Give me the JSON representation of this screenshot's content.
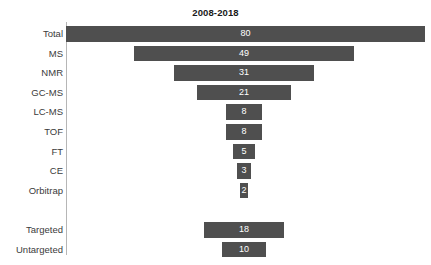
{
  "chart_data": {
    "type": "bar",
    "title": "2008-2018",
    "subtitle": "",
    "xlabel": "",
    "ylabel": "",
    "orientation": "horizontal",
    "grid": false,
    "legend": null,
    "xlim": [
      0,
      80
    ],
    "axis_visible": "y-spine-only",
    "tick_labels_x": [],
    "bar_color": "#4f4f4f",
    "value_label_color": "#ffffff",
    "background_color": "#ffffff",
    "categories": [
      "Total",
      "MS",
      "NMR",
      "GC-MS",
      "LC-MS",
      "TOF",
      "FT",
      "CE",
      "Orbitrap",
      "",
      "Targeted",
      "Untargeted"
    ],
    "values": [
      80,
      49,
      31,
      21,
      8,
      8,
      5,
      3,
      2,
      null,
      18,
      10
    ],
    "rows": [
      {
        "label": "Total",
        "value": 80,
        "value_text": "80",
        "align": "left",
        "spacer": false
      },
      {
        "label": "MS",
        "value": 49,
        "value_text": "49",
        "align": "center",
        "spacer": false
      },
      {
        "label": "NMR",
        "value": 31,
        "value_text": "31",
        "align": "center",
        "spacer": false
      },
      {
        "label": "GC-MS",
        "value": 21,
        "value_text": "21",
        "align": "center",
        "spacer": false
      },
      {
        "label": "LC-MS",
        "value": 8,
        "value_text": "8",
        "align": "center",
        "spacer": false
      },
      {
        "label": "TOF",
        "value": 8,
        "value_text": "8",
        "align": "center",
        "spacer": false
      },
      {
        "label": "FT",
        "value": 5,
        "value_text": "5",
        "align": "center",
        "spacer": false
      },
      {
        "label": "CE",
        "value": 3,
        "value_text": "3",
        "align": "center",
        "spacer": false
      },
      {
        "label": "Orbitrap",
        "value": 2,
        "value_text": "2",
        "align": "center",
        "spacer": false
      },
      {
        "label": "",
        "value": null,
        "value_text": "",
        "align": "center",
        "spacer": true
      },
      {
        "label": "Targeted",
        "value": 18,
        "value_text": "18",
        "align": "center",
        "spacer": false
      },
      {
        "label": "Untargeted",
        "value": 10,
        "value_text": "10",
        "align": "center",
        "spacer": false
      }
    ]
  },
  "layout": {
    "axis_x": 66,
    "axis_top": 22,
    "axis_bottom": 255,
    "row_pitch": 19.6,
    "first_row_top": 24,
    "bar_height": 15.6,
    "px_per_unit": 4.49,
    "funnel_center_x": 244,
    "label_right_edge": 63
  }
}
